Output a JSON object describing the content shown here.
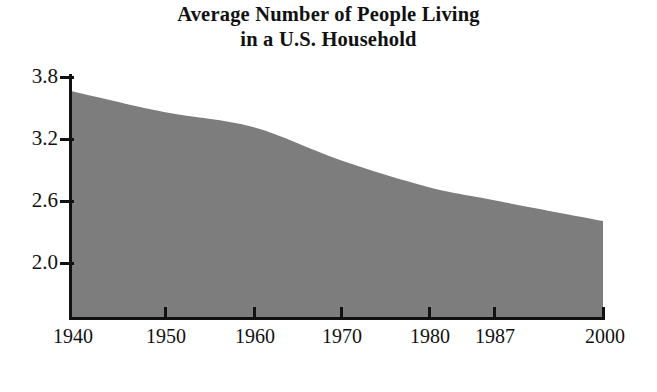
{
  "chart_data": {
    "type": "area",
    "title": "Average Number of People Living in a U.S. Household",
    "title_lines": [
      "Average Number of People Living",
      "in a U.S. Household"
    ],
    "xlabel": "",
    "ylabel": "",
    "categories": [
      "1940",
      "1950",
      "1960",
      "1970",
      "1980",
      "1987",
      "2000"
    ],
    "x": [
      1940,
      1950,
      1960,
      1970,
      1980,
      1987,
      2000
    ],
    "values": [
      3.73,
      3.52,
      3.37,
      3.04,
      2.77,
      2.64,
      2.43
    ],
    "series": [
      {
        "name": "Average people per household",
        "values": [
          3.73,
          3.52,
          3.37,
          3.04,
          2.77,
          2.64,
          2.43
        ]
      }
    ],
    "y_ticks": [
      "3.8",
      "3.2",
      "2.6",
      "2.0"
    ],
    "y_tick_values": [
      3.8,
      3.2,
      2.6,
      2.0
    ],
    "x_ticks": [
      "1940",
      "1950",
      "1960",
      "1970",
      "1980",
      "1987",
      "2000"
    ],
    "ylim": [
      1.46,
      3.88
    ],
    "xlim": [
      1940,
      2000
    ],
    "grid": false,
    "legend": false,
    "fill_color": "#7d7d7d",
    "axis_color": "#111111",
    "background_color": "#ffffff"
  },
  "axes": {
    "y_tick_labels": [
      {
        "label": "3.8",
        "top": 66
      },
      {
        "label": "3.2",
        "top": 128
      },
      {
        "label": "2.6",
        "top": 190
      },
      {
        "label": "2.0",
        "top": 252
      }
    ],
    "y_tick_marks": [
      76,
      138,
      200,
      262
    ],
    "x_tick_labels": [
      {
        "label": "1940",
        "x": 71
      },
      {
        "label": "1950",
        "x": 164
      },
      {
        "label": "1960",
        "x": 253
      },
      {
        "label": "1970",
        "x": 340
      },
      {
        "label": "1980",
        "x": 428
      },
      {
        "label": "1987",
        "x": 493
      },
      {
        "label": "2000",
        "x": 603
      }
    ],
    "x_tick_marks": [
      164,
      253,
      340,
      428,
      493,
      603
    ]
  }
}
